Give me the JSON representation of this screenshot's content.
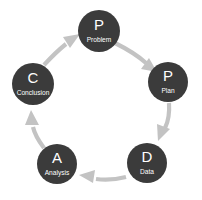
{
  "diagram": {
    "type": "cycle-diagram",
    "background_color": "#ffffff",
    "node_color": "#3b3b3b",
    "node_text_color": "#ffffff",
    "arrow_color": "#c3c3c3",
    "direction": "clockwise",
    "nodes": [
      {
        "id": "problem",
        "letter": "P",
        "label": "Problem",
        "cx": 99,
        "cy": 31,
        "r": 21
      },
      {
        "id": "plan",
        "letter": "P",
        "label": "Plan",
        "cx": 168,
        "cy": 82,
        "r": 20
      },
      {
        "id": "data",
        "letter": "D",
        "label": "Data",
        "cx": 147,
        "cy": 163,
        "r": 20
      },
      {
        "id": "analysis",
        "letter": "A",
        "label": "Analysis",
        "cx": 57,
        "cy": 164,
        "r": 20
      },
      {
        "id": "conclusion",
        "letter": "C",
        "label": "Conclusion",
        "cx": 33,
        "cy": 84,
        "r": 21
      }
    ],
    "arrows": [
      {
        "id": "problem-to-plan",
        "from": "problem",
        "to": "plan"
      },
      {
        "id": "plan-to-data",
        "from": "plan",
        "to": "data"
      },
      {
        "id": "data-to-analysis",
        "from": "data",
        "to": "analysis"
      },
      {
        "id": "analysis-to-conclusion",
        "from": "analysis",
        "to": "conclusion"
      },
      {
        "id": "conclusion-to-problem",
        "from": "conclusion",
        "to": "problem"
      }
    ]
  }
}
